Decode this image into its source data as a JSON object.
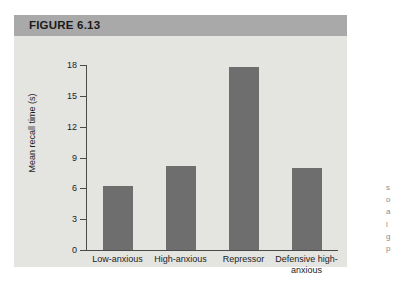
{
  "figure": {
    "header_title": "FIGURE 6.13"
  },
  "chart_data": {
    "type": "bar",
    "title": "FIGURE 6.13",
    "xlabel": "",
    "ylabel": "Mean recall time (s)",
    "categories": [
      "Low-anxious",
      "High-anxious",
      "Repressor",
      "Defensive high-anxious"
    ],
    "values": [
      6.2,
      8.2,
      17.8,
      8.0
    ],
    "ylim": [
      0,
      18
    ],
    "yticks": [
      0,
      3,
      6,
      9,
      12,
      15,
      18
    ],
    "ytick_labels": [
      "0",
      "3",
      "6",
      "9",
      "12",
      "15",
      "18"
    ],
    "grid": false,
    "legend": null,
    "bar_color": "#6e6e6e",
    "plot_background": "#e4e4e1",
    "header_background": "#a9a9a9",
    "axis_color": "#4a4a4a"
  },
  "caption_sliver": {
    "lines": [
      "s",
      "o",
      "a",
      "l",
      "g",
      "p"
    ]
  }
}
